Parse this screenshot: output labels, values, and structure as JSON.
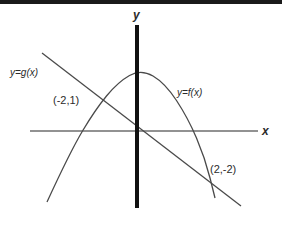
{
  "figure": {
    "kind": "coordinate-plane-graph",
    "background_color": "#ffffff",
    "top_band_color": "#1a1a1a"
  },
  "chart_data": {
    "type": "line",
    "title": "",
    "xlabel": "x",
    "ylabel": "y",
    "grid": false,
    "legend": "inline-curve-labels",
    "xlim": [
      -4.5,
      3.5
    ],
    "ylim": [
      -3.5,
      2.6
    ],
    "origin_px": {
      "x": 137,
      "y": 131
    },
    "axes": {
      "y_axis": {
        "label": "y",
        "color": "#111111",
        "width_px": 4,
        "x_px": 137,
        "y_top_px": 25,
        "y_bottom_px": 208
      },
      "x_axis": {
        "label": "x",
        "color": "#6e6e6e",
        "width_px": 1.6,
        "y_px": 131,
        "x_left_px": 30,
        "x_right_px": 258
      }
    },
    "series": [
      {
        "name": "y=f(x)",
        "shape": "parabola",
        "label": "y=f(x)",
        "color": "#4a4a4a",
        "opens": "down",
        "vertex_px": {
          "x": 141,
          "y": 69
        },
        "points_px": [
          {
            "x": 47,
            "y": 202
          },
          {
            "x": 70,
            "y": 152
          },
          {
            "x": 95,
            "y": 110
          },
          {
            "x": 118,
            "y": 82
          },
          {
            "x": 141,
            "y": 69
          },
          {
            "x": 165,
            "y": 83
          },
          {
            "x": 188,
            "y": 118
          },
          {
            "x": 205,
            "y": 158
          },
          {
            "x": 215,
            "y": 198
          }
        ]
      },
      {
        "name": "y=g(x)",
        "shape": "line",
        "label": "y=g(x)",
        "color": "#4a4a4a",
        "start_px": {
          "x": 42,
          "y": 53
        },
        "end_px": {
          "x": 241,
          "y": 206
        }
      }
    ],
    "annotations": [
      {
        "name": "intersection-left",
        "text": "(-2,1)",
        "x": -2,
        "y": 1,
        "label_px": {
          "x": 53,
          "y": 95
        },
        "point_px": {
          "x": 105,
          "y": 104
        }
      },
      {
        "name": "intersection-right",
        "text": "(2,-2)",
        "x": 2,
        "y": -2,
        "label_px": {
          "x": 210,
          "y": 164
        },
        "point_px": {
          "x": 208,
          "y": 178
        }
      }
    ],
    "curve_labels": [
      {
        "name": "g-label",
        "text": "y=g(x)",
        "label_px": {
          "x": 10,
          "y": 68
        }
      },
      {
        "name": "f-label",
        "text": "y=f(x)",
        "label_px": {
          "x": 177,
          "y": 88
        }
      }
    ],
    "axis_tick_labels": {
      "x": [],
      "y": []
    }
  }
}
